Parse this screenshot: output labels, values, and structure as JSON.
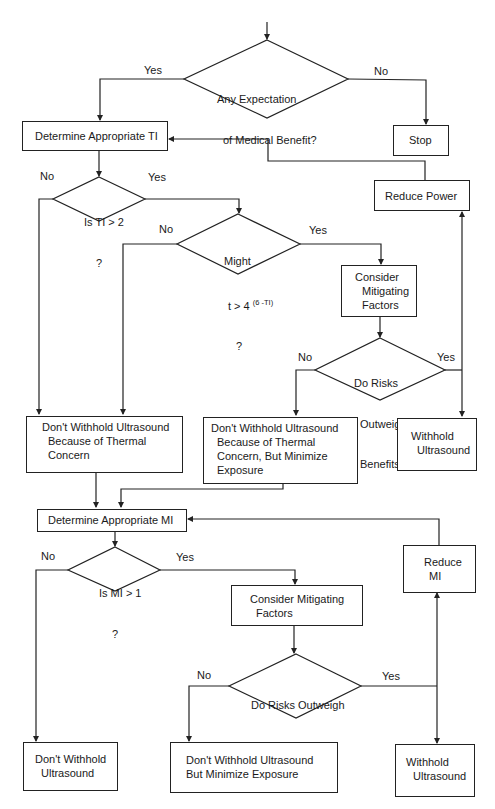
{
  "colors": {
    "line": "#222222",
    "text": "#1a1a1a",
    "background": "#ffffff"
  },
  "thermal": {
    "start_decision": {
      "line1": "Any Expectation",
      "line2": "of Medical Benefit?",
      "yes": "Yes",
      "no": "No"
    },
    "stop": "Stop",
    "determine_ti": "Determine Appropriate TI",
    "reduce_power": "Reduce Power",
    "ti_decision": {
      "line1": "Is TI > 2",
      "line2": "?",
      "yes": "Yes",
      "no": "No"
    },
    "time_decision": {
      "line1": "Might",
      "line2_base": "t > 4",
      "line2_exp": "(6 -TI)",
      "line3": "?",
      "yes": "Yes",
      "no": "No"
    },
    "mitigating": {
      "line1": "Consider",
      "line2": "Mitigating",
      "line3": "Factors"
    },
    "risk_decision": {
      "line1": "Do Risks",
      "line2": "Outweigh",
      "line3": "Benefits?",
      "yes": "Yes",
      "no": "No"
    },
    "dont_withhold": {
      "line1": "Don't Withhold Ultrasound",
      "line2": "Because of Thermal",
      "line3": "Concern"
    },
    "dont_withhold_minimize": {
      "line1": "Don't Withhold Ultrasound",
      "line2": "Because of Thermal",
      "line3": "Concern, But Minimize",
      "line4": "Exposure"
    },
    "withhold": {
      "line1": "Withhold",
      "line2": "Ultrasound"
    }
  },
  "mechanical": {
    "determine_mi": "Determine Appropriate MI",
    "reduce_mi": {
      "line1": "Reduce",
      "line2": "MI"
    },
    "mi_decision": {
      "line1": "Is MI > 1",
      "line2": "?",
      "yes": "Yes",
      "no": "No"
    },
    "mitigating": {
      "line1": "Consider Mitigating",
      "line2": "Factors"
    },
    "risk_decision": {
      "line1": "Do Risks Outweigh",
      "line2": "Benefits?",
      "yes": "Yes",
      "no": "No"
    },
    "dont_withhold": {
      "line1": "Don't Withhold",
      "line2": "Ultrasound"
    },
    "dont_withhold_minimize": {
      "line1": "Don't Withhold Ultrasound",
      "line2": "But Minimize Exposure"
    },
    "withhold": {
      "line1": "Withhold",
      "line2": "Ultrasound"
    }
  }
}
